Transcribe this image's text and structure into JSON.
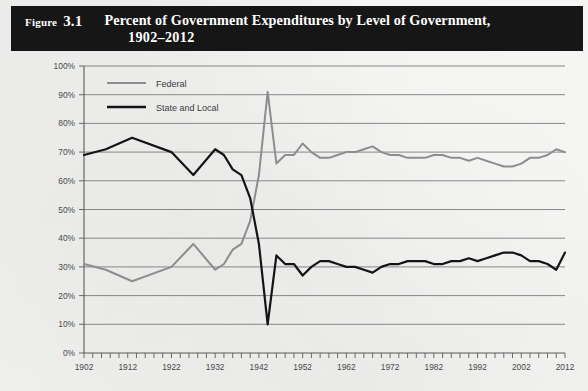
{
  "figure": {
    "label_word": "Figure",
    "number": "3.1",
    "title_line1": "Percent of Government Expenditures by Level of Government,",
    "title_line2": "1902–2012"
  },
  "colors": {
    "title_bar_background": "#161616",
    "title_bar_text": "#ffffff",
    "page_background": "#f0f0ee",
    "federal_line": "#8d8d8d",
    "state_local_line": "#141414",
    "gridline": "#7c7c7c",
    "axis": "#5a5a5a",
    "tick_label": "#4a4a4a"
  },
  "legend": {
    "position": "top-left-inside",
    "entries": [
      {
        "label": "Federal",
        "color": "#8d8d8d"
      },
      {
        "label": "State and Local",
        "color": "#141414"
      }
    ]
  },
  "axes": {
    "y_tick_labels": [
      "100%",
      "90%",
      "80%",
      "70%",
      "60%",
      "50%",
      "40%",
      "30%",
      "20%",
      "10%",
      "0%"
    ],
    "x_tick_labels": [
      "1902",
      "1912",
      "1922",
      "1932",
      "1942",
      "1952",
      "1962",
      "1972",
      "1982",
      "1992",
      "2002",
      "2012"
    ],
    "x_minor_tick_interval_years": 2
  },
  "chart_data": {
    "type": "line",
    "title": "Percent of Government Expenditures by Level of Government, 1902–2012",
    "xlabel": "",
    "ylabel": "",
    "xlim": [
      1902,
      2012
    ],
    "ylim": [
      0,
      100
    ],
    "grid": true,
    "legend_position": "upper left",
    "x": [
      1902,
      1907,
      1913,
      1922,
      1927,
      1932,
      1934,
      1936,
      1938,
      1940,
      1942,
      1944,
      1946,
      1948,
      1950,
      1952,
      1954,
      1956,
      1958,
      1960,
      1962,
      1964,
      1966,
      1968,
      1970,
      1972,
      1974,
      1976,
      1978,
      1980,
      1982,
      1984,
      1986,
      1988,
      1990,
      1992,
      1994,
      1996,
      1998,
      2000,
      2002,
      2004,
      2006,
      2008,
      2010,
      2012
    ],
    "series": [
      {
        "name": "Federal",
        "color": "#8d8d8d",
        "values": [
          31,
          29,
          25,
          30,
          38,
          29,
          31,
          36,
          38,
          46,
          62,
          91,
          66,
          69,
          69,
          73,
          70,
          68,
          68,
          69,
          70,
          70,
          71,
          72,
          70,
          69,
          69,
          68,
          68,
          68,
          69,
          69,
          68,
          68,
          67,
          68,
          67,
          66,
          65,
          65,
          66,
          68,
          68,
          69,
          71,
          70
        ]
      },
      {
        "name": "State and Local",
        "color": "#141414",
        "values": [
          69,
          71,
          75,
          70,
          62,
          71,
          69,
          64,
          62,
          54,
          38,
          10,
          34,
          31,
          31,
          27,
          30,
          32,
          32,
          31,
          30,
          30,
          29,
          28,
          30,
          31,
          31,
          32,
          32,
          32,
          31,
          31,
          32,
          32,
          33,
          32,
          33,
          34,
          35,
          35,
          34,
          32,
          32,
          31,
          29,
          35
        ]
      }
    ]
  }
}
